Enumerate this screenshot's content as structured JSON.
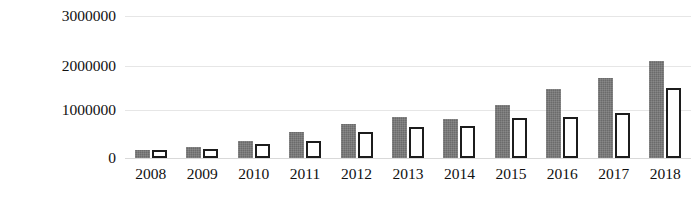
{
  "chart_data": {
    "type": "bar",
    "title": "",
    "xlabel": "",
    "ylabel": "",
    "grid": true,
    "legend": "none",
    "ylim": [
      0,
      3000000
    ],
    "yticks": [
      0,
      1000000,
      2000000,
      3000000
    ],
    "ytick_labels": [
      "0",
      "1000000",
      "2000000",
      "3000000"
    ],
    "categories": [
      "2008",
      "2009",
      "2010",
      "2011",
      "2012",
      "2013",
      "2014",
      "2015",
      "2016",
      "2017",
      "2018"
    ],
    "series": [
      {
        "name": "series-1",
        "style": "filled-dark-gray",
        "color": "#6b6b6b",
        "values": [
          170000,
          240000,
          370000,
          560000,
          720000,
          870000,
          830000,
          1110000,
          1460000,
          1690000,
          2050000
        ]
      },
      {
        "name": "series-2",
        "style": "white-fill-black-outline",
        "color": "#ffffff",
        "outline": "#1c1c1c",
        "values": [
          160000,
          180000,
          290000,
          370000,
          560000,
          650000,
          670000,
          840000,
          870000,
          960000,
          1470000
        ]
      }
    ]
  },
  "axis": {
    "y_label_0": "0",
    "y_label_1": "1000000",
    "y_label_2": "2000000",
    "y_label_3": "3000000"
  },
  "colors": {
    "series_1_fill": "#6b6b6b",
    "series_2_fill": "#ffffff",
    "series_2_stroke": "#1c1c1c",
    "gridline": "#e6e6e6",
    "text": "#111111",
    "background": "#ffffff"
  }
}
